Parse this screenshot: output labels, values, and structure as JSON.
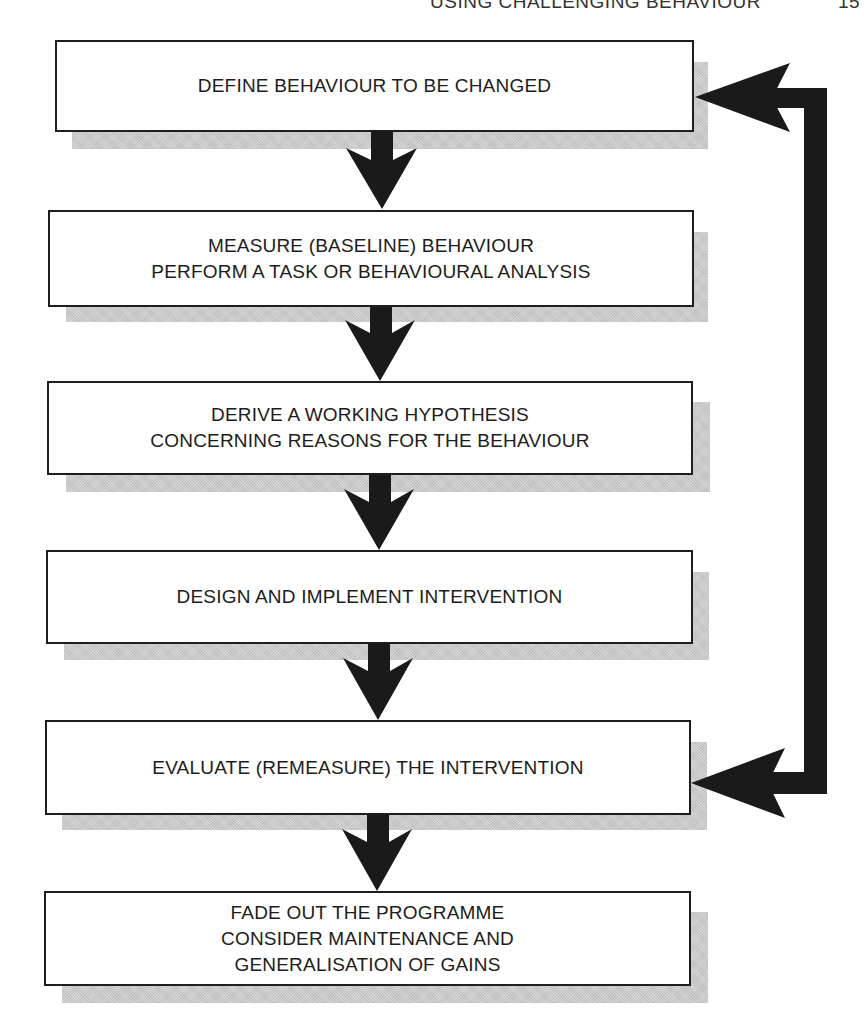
{
  "page_header": {
    "running_title": "USING CHALLENGING BEHAVIOUR",
    "page_number": "15"
  },
  "flowchart": {
    "steps": [
      {
        "lines": [
          "DEFINE BEHAVIOUR TO BE CHANGED"
        ]
      },
      {
        "lines": [
          "MEASURE (BASELINE) BEHAVIOUR",
          "PERFORM A TASK OR BEHAVIOURAL ANALYSIS"
        ]
      },
      {
        "lines": [
          "DERIVE A WORKING HYPOTHESIS",
          "CONCERNING REASONS FOR THE BEHAVIOUR"
        ]
      },
      {
        "lines": [
          "DESIGN AND IMPLEMENT INTERVENTION"
        ]
      },
      {
        "lines": [
          "EVALUATE (REMEASURE) THE INTERVENTION"
        ]
      },
      {
        "lines": [
          "FADE OUT THE PROGRAMME",
          "CONSIDER MAINTENANCE AND",
          "GENERALISATION OF GAINS"
        ]
      }
    ],
    "feedback_loop": {
      "from_step": 5,
      "to_step": 1
    }
  },
  "colors": {
    "arrow": "#1a1a1a",
    "box_border": "#1e1e1e",
    "shadow": "#c9c9c9",
    "background": "#ffffff"
  }
}
